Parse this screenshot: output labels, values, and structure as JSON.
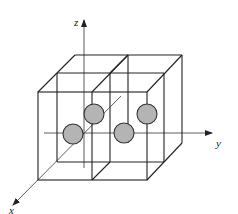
{
  "diagram": {
    "type": "crystal-structure-3d",
    "axes": {
      "x_label": "x",
      "y_label": "y",
      "z_label": "z"
    },
    "cells": 2,
    "atoms": [
      {
        "id": 1,
        "cx": 94,
        "cy": 114,
        "r": 10
      },
      {
        "id": 2,
        "cx": 73,
        "cy": 134,
        "r": 10
      },
      {
        "id": 3,
        "cx": 147,
        "cy": 114,
        "r": 10
      },
      {
        "id": 4,
        "cx": 124,
        "cy": 133,
        "r": 10
      }
    ],
    "colors": {
      "atom_fill": "#b4b4b4",
      "line": "#222222"
    }
  }
}
